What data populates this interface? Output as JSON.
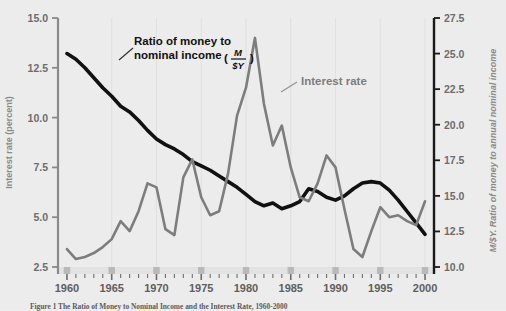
{
  "figure": {
    "background_color": "#ececec",
    "caption_label": "Figure 1",
    "caption_text": "The Ratio of Money to Nominal Income and the Interest Rate, 1960-2000"
  },
  "left_axis": {
    "title": "Interest rate (percent)",
    "ticks": [
      "2.5",
      "5.0",
      "7.5",
      "10.0",
      "12.5",
      "15.0"
    ],
    "min": 2.5,
    "max": 15.0,
    "step": 2.5,
    "color": "#7d7d7d"
  },
  "right_axis": {
    "title": "M/$Y. Ratio of money to annual nominal income",
    "ticks": [
      "10.0",
      "12.5",
      "15.0",
      "17.5",
      "20.0",
      "22.5",
      "25.0",
      "27.5"
    ],
    "min": 10.0,
    "max": 27.5,
    "step": 2.5,
    "color": "#111111"
  },
  "x_axis": {
    "labels": [
      "1960",
      "1965",
      "1970",
      "1975",
      "1980",
      "1985",
      "1990",
      "1995",
      "2000"
    ],
    "min": 1959,
    "max": 2001,
    "tick_step": 1,
    "major_step": 5
  },
  "annotations": {
    "money_ratio_line1": "Ratio of money to",
    "money_ratio_line2": "nominal income",
    "money_ratio_numerator": "M",
    "money_ratio_denominator": "$Y",
    "interest_rate": "Interest rate"
  },
  "chart_data": {
    "type": "line",
    "title": "The Ratio of Money to Nominal Income and the Interest Rate, 1960-2000",
    "xlabel": "",
    "ylabel": "Interest rate (percent)",
    "ylabel_right": "M/$Y. Ratio of money to annual nominal income",
    "xlim": [
      1959,
      2001
    ],
    "ylim": [
      2.5,
      15.0
    ],
    "ylim_right": [
      10.0,
      27.5
    ],
    "grid": false,
    "legend": "annotations",
    "x": [
      1960,
      1961,
      1962,
      1963,
      1964,
      1965,
      1966,
      1967,
      1968,
      1969,
      1970,
      1971,
      1972,
      1973,
      1974,
      1975,
      1976,
      1977,
      1978,
      1979,
      1980,
      1981,
      1982,
      1983,
      1984,
      1985,
      1986,
      1987,
      1988,
      1989,
      1990,
      1991,
      1992,
      1993,
      1994,
      1995,
      1996,
      1997,
      1998,
      1999,
      2000
    ],
    "series": [
      {
        "name": "Ratio of money to nominal income (M/$Y)",
        "axis": "right",
        "color": "#111111",
        "width": 3.6,
        "values": [
          25.0,
          24.6,
          24.0,
          23.3,
          22.6,
          22.0,
          21.3,
          20.9,
          20.3,
          19.6,
          19.0,
          18.6,
          18.3,
          17.9,
          17.4,
          17.1,
          16.8,
          16.4,
          16.0,
          15.6,
          15.1,
          14.6,
          14.3,
          14.5,
          14.1,
          14.3,
          14.6,
          15.5,
          15.3,
          14.9,
          14.7,
          15.0,
          15.5,
          15.9,
          16.0,
          15.9,
          15.4,
          14.7,
          13.9,
          13.1,
          12.3
        ],
        "comment_units": "percent of annual nominal income"
      },
      {
        "name": "Interest rate",
        "axis": "left",
        "color": "#7d7d7d",
        "width": 2.6,
        "values": [
          3.4,
          2.9,
          3.0,
          3.2,
          3.5,
          3.9,
          4.8,
          4.3,
          5.3,
          6.7,
          6.5,
          4.4,
          4.1,
          7.0,
          7.9,
          6.0,
          5.1,
          5.3,
          7.2,
          10.1,
          11.5,
          14.0,
          10.7,
          8.6,
          9.6,
          7.5,
          6.0,
          5.8,
          6.7,
          8.1,
          7.5,
          5.4,
          3.4,
          3.0,
          4.3,
          5.5,
          5.0,
          5.1,
          4.8,
          4.6,
          5.8
        ],
        "comment_units": "percent per year"
      }
    ]
  }
}
